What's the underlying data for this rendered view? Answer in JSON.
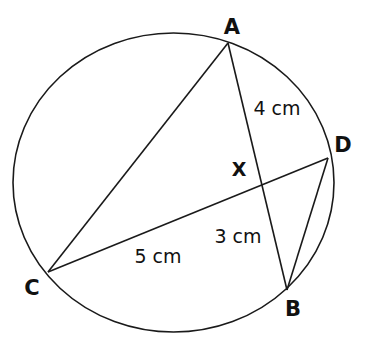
{
  "figure": {
    "type": "circle-geometry-diagram",
    "background_color": "#ffffff",
    "stroke_color": "#1a1a1a",
    "circle": {
      "center_x": 173.5,
      "center_y": 182.5,
      "radius_x": 160.5,
      "radius_y": 149.5
    },
    "vertices": [
      {
        "id": "A",
        "label": "A",
        "x": 228,
        "y": 43,
        "label_x": 232,
        "label_y": 27
      },
      {
        "id": "D",
        "label": "D",
        "x": 328,
        "y": 158,
        "label_x": 343,
        "label_y": 145
      },
      {
        "id": "B",
        "label": "B",
        "x": 287,
        "y": 290,
        "label_x": 293,
        "label_y": 309
      },
      {
        "id": "C",
        "label": "C",
        "x": 48,
        "y": 272,
        "label_x": 32,
        "label_y": 288
      }
    ],
    "intersection": {
      "id": "X",
      "label": "X",
      "x": 262.5,
      "y": 180,
      "label_x": 239,
      "label_y": 169
    },
    "chords": [
      {
        "id": "AB",
        "from": "A",
        "to": "B",
        "x1": 228,
        "y1": 43,
        "x2": 287,
        "y2": 290
      },
      {
        "id": "CD",
        "from": "C",
        "to": "D",
        "x1": 48,
        "y1": 272,
        "x2": 328,
        "y2": 158
      },
      {
        "id": "AC",
        "from": "A",
        "to": "C",
        "x1": 228,
        "y1": 43,
        "x2": 48,
        "y2": 272
      },
      {
        "id": "DB",
        "from": "D",
        "to": "B",
        "x1": 328,
        "y1": 158,
        "x2": 287,
        "y2": 290
      }
    ],
    "measurements": [
      {
        "id": "AX",
        "label": "4 cm",
        "value": 4,
        "unit": "cm",
        "segment": "A to X",
        "x": 277,
        "y": 108
      },
      {
        "id": "XB",
        "label": "3 cm",
        "value": 3,
        "unit": "cm",
        "segment": "X to B",
        "x": 238,
        "y": 236
      },
      {
        "id": "CX",
        "label": "5 cm",
        "value": 5,
        "unit": "cm",
        "segment": "C to X",
        "x": 158,
        "y": 256
      }
    ]
  }
}
